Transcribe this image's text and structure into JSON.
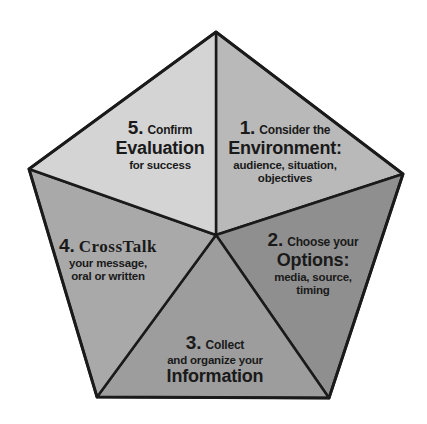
{
  "diagram": {
    "shape": "pentagon",
    "colors": {
      "outline": "#1a1a1a",
      "segment_1": "#b9b9b9",
      "segment_2": "#8f8f8f",
      "segment_3": "#9d9d9d",
      "segment_4": "#a9a9a9",
      "segment_5": "#d4d4d4"
    },
    "segments": [
      {
        "number": "1.",
        "lead": "Consider the",
        "keyword": "Environment:",
        "desc_line1": "audience, situation,",
        "desc_line2": "objectives"
      },
      {
        "number": "2.",
        "lead": "Choose your",
        "keyword": "Options:",
        "desc_line1": "media, source,",
        "desc_line2": "timing"
      },
      {
        "number": "3.",
        "lead": "Collect",
        "desc_line1": "and organize your",
        "keyword": "Information"
      },
      {
        "number": "4.",
        "keyword": "CrossTalk",
        "desc_line1": "your message,",
        "desc_line2": "oral or written"
      },
      {
        "number": "5.",
        "lead": "Confirm",
        "keyword": "Evaluation",
        "desc_line1": "for success"
      }
    ]
  }
}
